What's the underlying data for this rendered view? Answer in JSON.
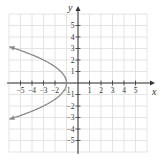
{
  "chart_data": {
    "type": "line",
    "title": "",
    "xlabel": "x",
    "ylabel": "y",
    "xlim": [
      -6,
      6
    ],
    "ylim": [
      -6,
      6
    ],
    "grid": true,
    "x_ticks": [
      -5,
      -4,
      -3,
      -2,
      -1,
      1,
      2,
      3,
      4,
      5
    ],
    "y_ticks": [
      -5,
      -4,
      -3,
      -2,
      -1,
      1,
      2,
      3,
      4,
      5
    ],
    "x_tick_labels": [
      "−5",
      "−4",
      "−3",
      "−2",
      "−1",
      "1",
      "2",
      "3",
      "4",
      "5"
    ],
    "y_tick_labels": [
      "−5",
      "−4",
      "−3",
      "−2",
      "−1",
      "1",
      "2",
      "3",
      "4",
      "5"
    ],
    "series": [
      {
        "name": "parabola",
        "description": "Left-opening parabola with vertex at (-1, 0), arrows at both ends",
        "vertex": [
          -1,
          0
        ],
        "equation": "x = -y^2/2 - 1",
        "points": [
          [
            -5.7,
            3.1
          ],
          [
            -4.1,
            2.5
          ],
          [
            -3,
            2
          ],
          [
            -2.1,
            1.5
          ],
          [
            -1.5,
            1
          ],
          [
            -1.1,
            0.5
          ],
          [
            -1,
            0
          ],
          [
            -1.1,
            -0.5
          ],
          [
            -1.5,
            -1
          ],
          [
            -2.1,
            -1.5
          ],
          [
            -3,
            -2
          ],
          [
            -4.1,
            -2.5
          ],
          [
            -5.7,
            -3.1
          ]
        ],
        "color": "#888888"
      }
    ]
  },
  "colors": {
    "axis": "#333333",
    "grid": "#dddddd",
    "curve": "#8a8a8a"
  }
}
